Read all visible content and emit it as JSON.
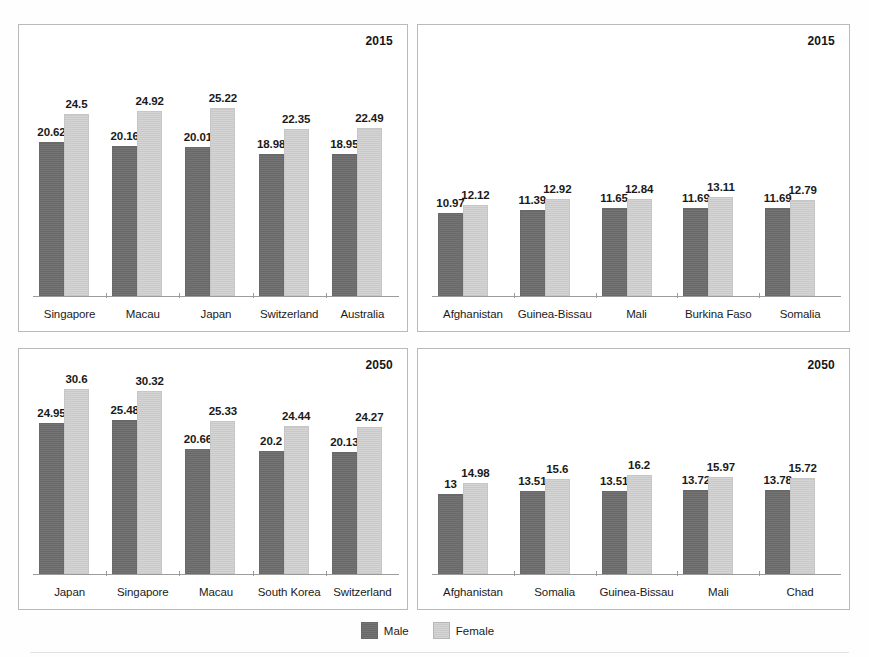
{
  "legend": {
    "entries": [
      {
        "label": "Male",
        "key": "male",
        "color": "#6e6e6e"
      },
      {
        "label": "Female",
        "key": "female",
        "color": "#cfcfcf"
      }
    ]
  },
  "colors": {
    "male": "#6e6e6e",
    "female": "#cfcfcf",
    "panel_border": "#b9b9b9",
    "axis": "#9c9c9c",
    "text": "#1b1b1b"
  },
  "panels": {
    "top_left": {
      "id": "panel-tl",
      "year": "2015"
    },
    "top_right": {
      "id": "panel-tr",
      "year": "2015"
    },
    "bottom_left": {
      "id": "panel-bl",
      "year": "2050"
    },
    "bottom_right": {
      "id": "panel-br",
      "year": "2050"
    }
  },
  "chart_data": [
    {
      "panel": "top_left",
      "type": "bar",
      "title": "2015",
      "xlabel": "",
      "ylabel": "",
      "ylim": [
        0,
        33
      ],
      "grid": false,
      "legend_position": "bottom-center",
      "categories": [
        "Singapore",
        "Macau",
        "Japan",
        "Switzerland",
        "Australia"
      ],
      "series": [
        {
          "name": "Male",
          "values": [
            20.62,
            20.16,
            20.01,
            18.98,
            18.95
          ]
        },
        {
          "name": "Female",
          "values": [
            24.5,
            24.92,
            25.22,
            22.35,
            22.49
          ]
        }
      ],
      "data_labels": [
        [
          "20.62",
          "24.5"
        ],
        [
          "20.16",
          "24.92"
        ],
        [
          "20.01",
          "25.22"
        ],
        [
          "18.98",
          "22.35"
        ],
        [
          "18.95",
          "22.49"
        ]
      ]
    },
    {
      "panel": "top_right",
      "type": "bar",
      "title": "2015",
      "xlabel": "",
      "ylabel": "",
      "ylim": [
        0,
        33
      ],
      "grid": false,
      "legend_position": "bottom-center",
      "categories": [
        "Afghanistan",
        "Guinea-Bissau",
        "Mali",
        "Burkina Faso",
        "Somalia"
      ],
      "series": [
        {
          "name": "Male",
          "values": [
            10.97,
            11.39,
            11.65,
            11.69,
            11.69
          ]
        },
        {
          "name": "Female",
          "values": [
            12.12,
            12.92,
            12.84,
            13.11,
            12.79
          ]
        }
      ],
      "data_labels": [
        [
          "10.97",
          "12.12"
        ],
        [
          "11.39",
          "12.92"
        ],
        [
          "11.65",
          "12.84"
        ],
        [
          "11.69",
          "13.11"
        ],
        [
          "11.69",
          "12.79"
        ]
      ]
    },
    {
      "panel": "bottom_left",
      "type": "bar",
      "title": "2050",
      "xlabel": "",
      "ylabel": "",
      "ylim": [
        0,
        33
      ],
      "grid": false,
      "legend_position": "bottom-center",
      "categories": [
        "Japan",
        "Singapore",
        "Macau",
        "South Korea",
        "Switzerland"
      ],
      "series": [
        {
          "name": "Male",
          "values": [
            24.95,
            25.48,
            20.66,
            20.2,
            20.13
          ]
        },
        {
          "name": "Female",
          "values": [
            30.6,
            30.32,
            25.33,
            24.44,
            24.27
          ]
        }
      ],
      "data_labels": [
        [
          "24.95",
          "30.6"
        ],
        [
          "25.48",
          "30.32"
        ],
        [
          "20.66",
          "25.33"
        ],
        [
          "20.2",
          "24.44"
        ],
        [
          "20.13",
          "24.27"
        ]
      ]
    },
    {
      "panel": "bottom_right",
      "type": "bar",
      "title": "2050",
      "xlabel": "",
      "ylabel": "",
      "ylim": [
        0,
        33
      ],
      "grid": false,
      "legend_position": "bottom-center",
      "categories": [
        "Afghanistan",
        "Somalia",
        "Guinea-Bissau",
        "Mali",
        "Chad"
      ],
      "series": [
        {
          "name": "Male",
          "values": [
            13,
            13.51,
            13.51,
            13.72,
            13.78
          ]
        },
        {
          "name": "Female",
          "values": [
            14.98,
            15.6,
            16.2,
            15.97,
            15.72
          ]
        }
      ],
      "data_labels": [
        [
          "13",
          "14.98"
        ],
        [
          "13.51",
          "15.6"
        ],
        [
          "13.51",
          "16.2"
        ],
        [
          "13.72",
          "15.97"
        ],
        [
          "13.78",
          "15.72"
        ]
      ]
    }
  ]
}
